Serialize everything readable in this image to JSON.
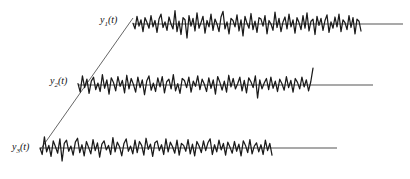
{
  "figure": {
    "title": "",
    "width": 410,
    "height": 179,
    "background_color": "#ffffff"
  },
  "labels": {
    "y1": {
      "base": "y",
      "sub": "1",
      "arg": "(t)",
      "full": "y1(t)"
    },
    "y2": {
      "base": "y",
      "sub": "2",
      "arg": "(t)",
      "full": "y2(t)"
    },
    "y3": {
      "base": "y",
      "sub": "3",
      "arg": "(t)",
      "full": "y3(t)"
    }
  },
  "colors": {
    "signal": "#1a1a1a",
    "baseline": "#555555",
    "diagonal": "#555555",
    "label": "#111111"
  },
  "chart_data": {
    "type": "line",
    "title": "",
    "xlabel": "",
    "ylabel": "",
    "grid": false,
    "legend": "inline-left-labels",
    "axis_ranges": {
      "x": [
        0,
        410
      ],
      "y": [
        0,
        179
      ]
    },
    "annotations": [
      {
        "name": "diagonal-connector",
        "description": "straight line connecting the start of y3(t) up to the start of y1(t)",
        "x1": 40,
        "y1": 150,
        "x2": 133,
        "y2": 18
      }
    ],
    "series": [
      {
        "name": "y1(t)",
        "label": "y1(t)",
        "baseline_y": 24,
        "label_x": 100,
        "label_y": 23,
        "signal_start_x": 133,
        "signal_end_x": 361,
        "baseline_start_x": 133,
        "baseline_end_x": 403,
        "amplitude": 14,
        "values": [
          0.05,
          -0.35,
          0.55,
          -0.15,
          0.3,
          -0.55,
          0.45,
          0.1,
          -0.3,
          0.6,
          -0.2,
          0.25,
          -0.6,
          0.35,
          0.7,
          -0.25,
          0.15,
          -0.45,
          0.5,
          0.0,
          -0.35,
          0.95,
          -0.55,
          0.2,
          -0.75,
          0.45,
          0.3,
          -1.0,
          0.6,
          -0.15,
          0.4,
          -0.5,
          0.8,
          -0.3,
          0.1,
          0.55,
          -0.65,
          0.25,
          -0.2,
          0.7,
          -0.45,
          0.35,
          0.0,
          -0.55,
          0.5,
          0.9,
          -0.35,
          0.15,
          -0.7,
          0.4,
          0.25,
          -0.2,
          0.65,
          -0.5,
          0.3,
          -0.85,
          0.55,
          0.05,
          -0.3,
          0.75,
          -0.4,
          0.2,
          -0.6,
          0.45,
          0.35,
          -0.15,
          0.6,
          -0.7,
          0.25,
          0.0,
          -0.45,
          0.85,
          -0.25,
          0.4,
          -0.55,
          0.15,
          0.5,
          -0.35,
          0.7,
          -0.2,
          0.3,
          -0.65,
          0.45,
          0.1,
          -0.4,
          0.6,
          -0.3,
          0.8,
          -0.5,
          0.2,
          0.35,
          -0.75,
          0.55,
          -0.1,
          0.4,
          -0.45,
          0.25,
          0.65,
          -0.6,
          0.15,
          -0.3,
          0.5,
          -0.2,
          0.7,
          -0.55,
          0.3,
          0.1,
          -0.4,
          0.6,
          -0.25,
          0.45,
          -0.7,
          0.35,
          0.2,
          -0.5
        ]
      },
      {
        "name": "y2(t)",
        "label": "y2(t)",
        "baseline_y": 85,
        "label_x": 50,
        "label_y": 84,
        "signal_start_x": 78,
        "signal_end_x": 313,
        "baseline_start_x": 78,
        "baseline_end_x": 373,
        "amplitude": 13,
        "values": [
          0.1,
          -0.55,
          0.7,
          -0.2,
          0.45,
          -0.65,
          0.3,
          0.6,
          -0.35,
          0.15,
          -0.5,
          0.8,
          -0.25,
          0.4,
          -0.7,
          0.55,
          0.2,
          -0.45,
          0.65,
          -0.1,
          0.35,
          -0.6,
          0.75,
          -0.3,
          0.5,
          0.05,
          -0.55,
          0.6,
          -0.2,
          0.4,
          -0.75,
          0.3,
          0.7,
          -0.4,
          0.15,
          -0.5,
          0.55,
          -0.15,
          0.65,
          -0.6,
          0.25,
          0.45,
          -0.3,
          0.8,
          -0.45,
          0.1,
          -0.65,
          0.5,
          0.35,
          -0.2,
          0.6,
          -0.55,
          0.3,
          -0.1,
          0.7,
          -0.35,
          0.45,
          0.05,
          -0.5,
          0.55,
          -0.25,
          0.4,
          -0.7,
          0.65,
          0.2,
          -0.4,
          0.3,
          -0.55,
          0.75,
          -0.15,
          0.5,
          -0.3,
          0.1,
          0.6,
          -0.45,
          0.35,
          -0.6,
          0.55,
          0.25,
          -0.2,
          0.7,
          -1.0,
          0.4,
          -0.3,
          0.15,
          0.5,
          -0.35,
          0.6,
          -0.25,
          0.3,
          -0.5,
          0.45,
          0.1,
          -0.4,
          0.65,
          -0.2,
          0.35,
          -0.55,
          0.5,
          0.2,
          -0.3,
          0.6,
          -0.15,
          0.4,
          -0.45,
          0.25,
          1.3
        ]
      },
      {
        "name": "y3(t)",
        "label": "y3(t)",
        "baseline_y": 148,
        "label_x": 12,
        "label_y": 150,
        "signal_start_x": 40,
        "signal_end_x": 272,
        "baseline_start_x": 40,
        "baseline_end_x": 337,
        "amplitude": 13,
        "values": [
          0.0,
          -0.5,
          0.85,
          -0.3,
          0.2,
          -0.65,
          0.55,
          0.1,
          -0.4,
          0.7,
          -1.0,
          0.35,
          0.6,
          -0.25,
          0.15,
          -0.55,
          0.45,
          0.75,
          -0.35,
          0.25,
          -0.6,
          0.5,
          0.05,
          -0.45,
          0.65,
          -0.2,
          0.4,
          -0.7,
          0.3,
          0.55,
          -0.15,
          0.2,
          -0.5,
          0.8,
          -0.3,
          0.45,
          0.1,
          -0.6,
          0.35,
          0.7,
          -0.25,
          0.15,
          -0.45,
          0.6,
          -0.35,
          0.5,
          0.2,
          -0.55,
          0.75,
          -0.1,
          0.3,
          -0.65,
          0.4,
          0.55,
          -0.2,
          0.25,
          -0.5,
          0.7,
          -0.3,
          0.45,
          0.1,
          -0.4,
          0.6,
          -0.55,
          0.35,
          0.2,
          -0.25,
          0.65,
          -0.45,
          0.3,
          -0.6,
          0.5,
          0.15,
          -0.35,
          0.55,
          -0.2,
          0.4,
          0.7,
          -0.5,
          0.25,
          -0.3,
          0.6,
          -0.15,
          0.35,
          -0.55,
          0.45,
          0.05,
          -0.4,
          0.5,
          -0.25,
          0.3,
          -0.6,
          0.55,
          0.2,
          -0.35,
          0.65,
          -0.45,
          0.15,
          0.4,
          -0.3,
          0.25,
          -0.5,
          0.6,
          -0.2,
          0.35,
          -0.55
        ]
      }
    ]
  }
}
